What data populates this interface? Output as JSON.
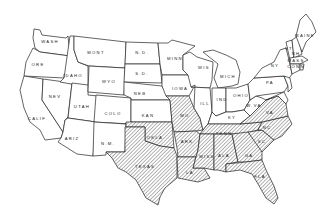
{
  "map": {
    "title": "",
    "hatch_color": "#555555",
    "outline_color": "#222222",
    "background": "#ffffff",
    "states": [
      {
        "id": "wash",
        "label": "WASH",
        "x": 50,
        "y": 43,
        "hatched": false
      },
      {
        "id": "ore",
        "label": "ORE",
        "x": 38,
        "y": 66,
        "hatched": false
      },
      {
        "id": "calif",
        "label": "CALIF",
        "x": 37,
        "y": 120,
        "hatched": false
      },
      {
        "id": "idaho",
        "label": "IDAHO",
        "x": 73,
        "y": 77,
        "hatched": false
      },
      {
        "id": "nev",
        "label": "NEV",
        "x": 55,
        "y": 98,
        "hatched": false
      },
      {
        "id": "utah",
        "label": "UTAH",
        "x": 82,
        "y": 108,
        "hatched": false
      },
      {
        "id": "ariz",
        "label": "ARIZ",
        "x": 72,
        "y": 140,
        "hatched": false
      },
      {
        "id": "mont",
        "label": "MONT",
        "x": 96,
        "y": 54,
        "hatched": false
      },
      {
        "id": "wyo",
        "label": "WYO",
        "x": 109,
        "y": 83,
        "hatched": false
      },
      {
        "id": "colo",
        "label": "COLO",
        "x": 113,
        "y": 115,
        "hatched": false
      },
      {
        "id": "nm",
        "label": "N.M.",
        "x": 108,
        "y": 145,
        "hatched": false
      },
      {
        "id": "nd",
        "label": "N.D.",
        "x": 142,
        "y": 54,
        "hatched": false
      },
      {
        "id": "sd",
        "label": "S.D.",
        "x": 142,
        "y": 75,
        "hatched": false
      },
      {
        "id": "neb",
        "label": "NEB",
        "x": 140,
        "y": 95,
        "hatched": false
      },
      {
        "id": "kan",
        "label": "KAN",
        "x": 148,
        "y": 117,
        "hatched": false
      },
      {
        "id": "okla",
        "label": "OKLA",
        "x": 155,
        "y": 139,
        "hatched": false
      },
      {
        "id": "texas",
        "label": "TEXAS",
        "x": 145,
        "y": 168,
        "hatched": true
      },
      {
        "id": "minn",
        "label": "MINN",
        "x": 175,
        "y": 60,
        "hatched": false
      },
      {
        "id": "iowa",
        "label": "IOWA",
        "x": 180,
        "y": 90,
        "hatched": false
      },
      {
        "id": "mo",
        "label": "MO",
        "x": 185,
        "y": 117,
        "hatched": false
      },
      {
        "id": "ark",
        "label": "ARK",
        "x": 187,
        "y": 143,
        "hatched": true
      },
      {
        "id": "la",
        "label": "LA",
        "x": 190,
        "y": 174,
        "hatched": true
      },
      {
        "id": "wis",
        "label": "WIS",
        "x": 204,
        "y": 69,
        "hatched": false
      },
      {
        "id": "ill",
        "label": "ILL",
        "x": 205,
        "y": 105,
        "hatched": false
      },
      {
        "id": "mich",
        "label": "MICH",
        "x": 228,
        "y": 78,
        "hatched": false
      },
      {
        "id": "ind",
        "label": "IND",
        "x": 222,
        "y": 101,
        "hatched": false
      },
      {
        "id": "ohio",
        "label": "OHIO",
        "x": 241,
        "y": 97,
        "hatched": false
      },
      {
        "id": "ky",
        "label": "KY",
        "x": 232,
        "y": 119,
        "hatched": false
      },
      {
        "id": "tenn",
        "label": "TENN",
        "x": 224,
        "y": 135,
        "hatched": true
      },
      {
        "id": "miss",
        "label": "MISS",
        "x": 207,
        "y": 158,
        "hatched": true
      },
      {
        "id": "ala",
        "label": "ALA",
        "x": 224,
        "y": 157,
        "hatched": true
      },
      {
        "id": "ga",
        "label": "GA",
        "x": 249,
        "y": 157,
        "hatched": true
      },
      {
        "id": "fla",
        "label": "FLA",
        "x": 260,
        "y": 178,
        "hatched": true
      },
      {
        "id": "sc",
        "label": "SC",
        "x": 262,
        "y": 143,
        "hatched": true
      },
      {
        "id": "nc",
        "label": "NC",
        "x": 267,
        "y": 129,
        "hatched": true
      },
      {
        "id": "va",
        "label": "VA",
        "x": 270,
        "y": 114,
        "hatched": true
      },
      {
        "id": "wva",
        "label": "W.VA",
        "x": 254,
        "y": 107,
        "hatched": false
      },
      {
        "id": "pa",
        "label": "PA",
        "x": 270,
        "y": 84,
        "hatched": false
      },
      {
        "id": "ny",
        "label": "NY",
        "x": 275,
        "y": 67,
        "hatched": false
      },
      {
        "id": "vt",
        "label": "VT",
        "x": 289,
        "y": 50,
        "hatched": false
      },
      {
        "id": "nh",
        "label": "NH",
        "x": 296,
        "y": 55,
        "hatched": false
      },
      {
        "id": "maine",
        "label": "MAINE",
        "x": 305,
        "y": 37,
        "hatched": false
      },
      {
        "id": "mass",
        "label": "MASS",
        "x": 296,
        "y": 62,
        "hatched": false
      },
      {
        "id": "conn",
        "label": "CONN",
        "x": 296,
        "y": 68,
        "hatched": false
      }
    ]
  }
}
